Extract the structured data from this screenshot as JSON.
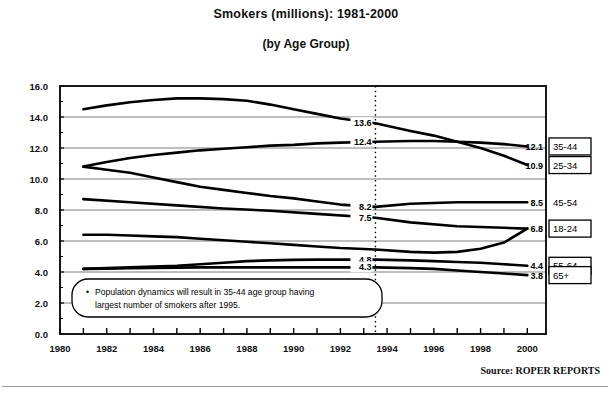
{
  "chart_data": {
    "type": "line",
    "title": "Smokers (millions): 1981-2000",
    "subtitle": "(by Age Group)",
    "xlabel": "",
    "ylabel": "",
    "xlim": [
      1980,
      2000.8
    ],
    "ylim": [
      0.0,
      16.0
    ],
    "grid": true,
    "legend_position": "right",
    "x_ticks": [
      1980,
      1982,
      1984,
      1986,
      1988,
      1990,
      1992,
      1994,
      1996,
      1998,
      2000
    ],
    "x_tick_labels": [
      "1980",
      "1982",
      "1984",
      "1986",
      "1988",
      "1990",
      "1992",
      "1994",
      "1996",
      "1998",
      "2000"
    ],
    "x_minor_ticks": [
      1981,
      1983,
      1985,
      1987,
      1989,
      1991,
      1993,
      1995,
      1997,
      1999
    ],
    "y_ticks": [
      0.0,
      2.0,
      4.0,
      6.0,
      8.0,
      10.0,
      12.0,
      14.0,
      16.0
    ],
    "y_tick_labels": [
      "0.0",
      "2.0",
      "4.0",
      "6.0",
      "8.0",
      "10.0",
      "12.0",
      "14.0",
      "16.0"
    ],
    "reference_line_x": 1993.5,
    "series": [
      {
        "name": "25-34",
        "legend_label": "25-34",
        "legend_boxed": true,
        "x": [
          1981,
          1982,
          1983,
          1984,
          1985,
          1986,
          1987,
          1988,
          1989,
          1990,
          1991,
          1992,
          1993.5,
          1995,
          1996,
          1997,
          1998,
          1999,
          2000
        ],
        "values": [
          14.5,
          14.75,
          14.95,
          15.1,
          15.2,
          15.2,
          15.15,
          15.05,
          14.8,
          14.5,
          14.2,
          13.9,
          13.6,
          13.1,
          12.8,
          12.4,
          12.0,
          11.5,
          10.9
        ],
        "label_at_reference": "13.6",
        "label_at_end": "10.9"
      },
      {
        "name": "35-44",
        "legend_label": "35-44",
        "legend_boxed": true,
        "x": [
          1981,
          1982,
          1983,
          1984,
          1985,
          1986,
          1987,
          1988,
          1989,
          1990,
          1991,
          1992,
          1993.5,
          1995,
          1996,
          1997,
          1998,
          1999,
          2000
        ],
        "values": [
          10.8,
          11.1,
          11.35,
          11.55,
          11.7,
          11.85,
          11.95,
          12.05,
          12.15,
          12.2,
          12.3,
          12.35,
          12.4,
          12.45,
          12.45,
          12.4,
          12.35,
          12.25,
          12.1
        ],
        "label_at_reference": "12.4",
        "label_at_end": "12.1"
      },
      {
        "name": "45-54",
        "legend_label": "45-54",
        "legend_boxed": false,
        "x": [
          1981,
          1982,
          1983,
          1984,
          1985,
          1986,
          1987,
          1988,
          1989,
          1990,
          1991,
          1992,
          1993.5,
          1995,
          1996,
          1997,
          1998,
          1999,
          2000
        ],
        "values": [
          10.8,
          10.6,
          10.4,
          10.1,
          9.8,
          9.5,
          9.3,
          9.1,
          8.9,
          8.75,
          8.55,
          8.35,
          8.2,
          8.4,
          8.45,
          8.5,
          8.5,
          8.5,
          8.5
        ],
        "label_at_reference": "8.2",
        "label_at_end": "8.5"
      },
      {
        "name": "18-24",
        "legend_label": "18-24",
        "legend_boxed": true,
        "x": [
          1981,
          1982,
          1983,
          1984,
          1985,
          1986,
          1987,
          1988,
          1989,
          1990,
          1991,
          1992,
          1993.5,
          1995,
          1996,
          1997,
          1998,
          1999,
          2000
        ],
        "values": [
          6.4,
          6.4,
          6.35,
          6.3,
          6.25,
          6.15,
          6.05,
          5.95,
          5.85,
          5.75,
          5.65,
          5.55,
          5.45,
          5.3,
          5.25,
          5.3,
          5.5,
          5.9,
          6.8
        ],
        "label_at_reference": "7.5",
        "label_at_end": "6.8"
      },
      {
        "name": "55-64",
        "legend_label": "55-64",
        "legend_boxed": true,
        "x": [
          1981,
          1982,
          1983,
          1984,
          1985,
          1986,
          1987,
          1988,
          1989,
          1990,
          1991,
          1992,
          1993.5,
          1995,
          1996,
          1997,
          1998,
          1999,
          2000
        ],
        "values": [
          4.2,
          4.25,
          4.3,
          4.35,
          4.4,
          4.5,
          4.6,
          4.7,
          4.75,
          4.78,
          4.8,
          4.8,
          4.8,
          4.75,
          4.7,
          4.65,
          4.6,
          4.5,
          4.4
        ],
        "label_at_reference": "4.8",
        "label_at_end": "4.4"
      },
      {
        "name": "65+",
        "legend_label": "65+",
        "legend_boxed": true,
        "x": [
          1981,
          1982,
          1983,
          1984,
          1985,
          1986,
          1987,
          1988,
          1989,
          1990,
          1991,
          1992,
          1993.5,
          1995,
          1996,
          1997,
          1998,
          1999,
          2000
        ],
        "values": [
          4.2,
          4.22,
          4.24,
          4.26,
          4.28,
          4.3,
          4.3,
          4.3,
          4.3,
          4.3,
          4.3,
          4.3,
          4.3,
          4.25,
          4.2,
          4.1,
          4.0,
          3.9,
          3.8
        ],
        "label_at_reference": "4.3",
        "label_at_end": "3.8"
      },
      {
        "name": "7.5-curve",
        "legend_label": "",
        "legend_boxed": false,
        "x": [
          1981,
          1983,
          1985,
          1987,
          1989,
          1991,
          1993.5,
          1995,
          1997,
          1999,
          2000
        ],
        "values": [
          8.7,
          8.5,
          8.3,
          8.1,
          7.95,
          7.75,
          7.5,
          7.2,
          6.95,
          6.85,
          6.8
        ],
        "label_at_reference": "",
        "label_at_end": ""
      }
    ],
    "value_labels_at_reference": [
      {
        "series": "25-34",
        "text": "13.6",
        "x": 1993.5,
        "y": 13.6
      },
      {
        "series": "35-44",
        "text": "12.4",
        "x": 1993.5,
        "y": 12.4
      },
      {
        "series": "45-54",
        "text": "8.2",
        "x": 1993.5,
        "y": 8.2
      },
      {
        "series": "18-24",
        "text": "7.5",
        "x": 1993.5,
        "y": 7.5
      },
      {
        "series": "55-64",
        "text": "4.8",
        "x": 1993.5,
        "y": 4.8
      },
      {
        "series": "65+",
        "text": "4.3",
        "x": 1993.5,
        "y": 4.3
      }
    ],
    "value_labels_at_end": [
      {
        "series": "35-44",
        "text": "12.1",
        "y": 12.1
      },
      {
        "series": "25-34",
        "text": "10.9",
        "y": 10.9
      },
      {
        "series": "45-54",
        "text": "8.5",
        "y": 8.5
      },
      {
        "series": "18-24",
        "text": "6.8",
        "y": 6.8
      },
      {
        "series": "55-64",
        "text": "4.4",
        "y": 4.4
      },
      {
        "series": "65+",
        "text": "3.8",
        "y": 3.8
      }
    ],
    "annotation": {
      "bullet": "•",
      "line1": "Population dynamics will result in 35-44 age group having",
      "line2": "largest number of smokers after 1995."
    },
    "source": "Source:  ROPER REPORTS",
    "colors": {
      "line": "#000000",
      "grid": "#6f6f6f",
      "axis": "#000000",
      "text": "#000000",
      "background": "#ffffff"
    }
  }
}
